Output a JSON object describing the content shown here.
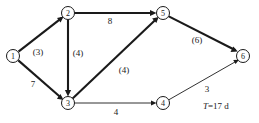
{
  "diagram": {
    "type": "activity-on-arrow-network",
    "nodes": [
      {
        "id": "1",
        "label": "1",
        "x": 13,
        "y": 56
      },
      {
        "id": "2",
        "label": "2",
        "x": 68,
        "y": 13
      },
      {
        "id": "3",
        "label": "3",
        "x": 68,
        "y": 103
      },
      {
        "id": "4",
        "label": "4",
        "x": 163,
        "y": 103
      },
      {
        "id": "5",
        "label": "5",
        "x": 163,
        "y": 13
      },
      {
        "id": "6",
        "label": "6",
        "x": 243,
        "y": 56
      }
    ],
    "edges": [
      {
        "id": "e1-2",
        "from": "1",
        "to": "2",
        "label": "(3)",
        "label_x": 38,
        "label_y": 52,
        "emphasis": "bold"
      },
      {
        "id": "e1-3",
        "from": "1",
        "to": "3",
        "label": "7",
        "label_x": 33,
        "label_y": 84,
        "emphasis": "bold"
      },
      {
        "id": "e2-3",
        "from": "2",
        "to": "3",
        "label": "(4)",
        "label_x": 78,
        "label_y": 53,
        "emphasis": "bold"
      },
      {
        "id": "e2-5",
        "from": "2",
        "to": "5",
        "label": "8",
        "label_x": 110,
        "label_y": 21,
        "emphasis": "bold"
      },
      {
        "id": "e3-5",
        "from": "3",
        "to": "5",
        "label": "(4)",
        "label_x": 124,
        "label_y": 70,
        "emphasis": "bold"
      },
      {
        "id": "e3-4",
        "from": "3",
        "to": "4",
        "label": "4",
        "label_x": 116,
        "label_y": 112,
        "emphasis": "thin"
      },
      {
        "id": "e5-6",
        "from": "5",
        "to": "6",
        "label": "(6)",
        "label_x": 197,
        "label_y": 40,
        "emphasis": "bold"
      },
      {
        "id": "e4-6",
        "from": "4",
        "to": "6",
        "label": "3",
        "label_x": 207,
        "label_y": 89,
        "emphasis": "thin"
      }
    ],
    "annotation": {
      "symbol": "T",
      "text": "=17 d",
      "full": "T=17 d",
      "x": 203,
      "y": 101
    },
    "style": {
      "stroke_color": "#1a1a1a",
      "background_color": "#ffffff",
      "node_radius": 6.5
    }
  }
}
